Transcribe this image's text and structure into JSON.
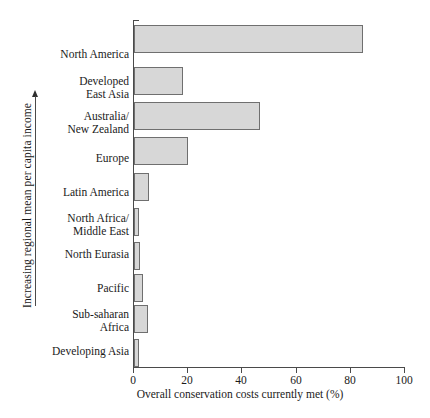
{
  "chart_data": {
    "type": "bar",
    "orientation": "horizontal",
    "title": "",
    "xlabel": "Overall conservation costs currently met (%)",
    "ylabel": "Increasing regional mean per capita income",
    "categories": [
      "North America",
      "Developed\nEast Asia",
      "Australia/\nNew Zealand",
      "Europe",
      "Latin America",
      "North Africa/\nMiddle East",
      "North Eurasia",
      "Pacific",
      "Sub-saharan\nAfrica",
      "Developing Asia"
    ],
    "values": [
      84.5,
      18,
      46.5,
      20,
      5.5,
      1.8,
      2.2,
      3.5,
      5,
      1.8
    ],
    "xlim": [
      0,
      100
    ],
    "xticks": [
      0,
      20,
      40,
      60,
      80,
      100
    ],
    "xticklabels": [
      "0",
      "20",
      "40",
      "60",
      "80",
      "100"
    ],
    "grid": false,
    "legend": false,
    "bar_fill_color": "#d7d7d7",
    "bar_edge_color": "#6f6f6f",
    "axis_color": "#4a4a4a",
    "background_color": "#ffffff",
    "y_axis_direction_hint": "increasing upward"
  },
  "axis": {
    "y_caption": "Increasing regional mean per capita income",
    "x_title": "Overall conservation costs currently met (%)"
  },
  "labels": {
    "north_america": "North America",
    "developed_east_asia_l1": "Developed",
    "developed_east_asia_l2": "East Asia",
    "australia_nz_l1": "Australia/",
    "australia_nz_l2": "New Zealand",
    "europe": "Europe",
    "latin_america": "Latin America",
    "north_africa_me_l1": "North Africa/",
    "north_africa_me_l2": "Middle East",
    "north_eurasia": "North Eurasia",
    "pacific": "Pacific",
    "subsaharan_africa_l1": "Sub-saharan",
    "subsaharan_africa_l2": "Africa",
    "developing_asia": "Developing Asia"
  },
  "ticks": {
    "t0": "0",
    "t20": "20",
    "t40": "40",
    "t60": "60",
    "t80": "80",
    "t100": "100"
  }
}
